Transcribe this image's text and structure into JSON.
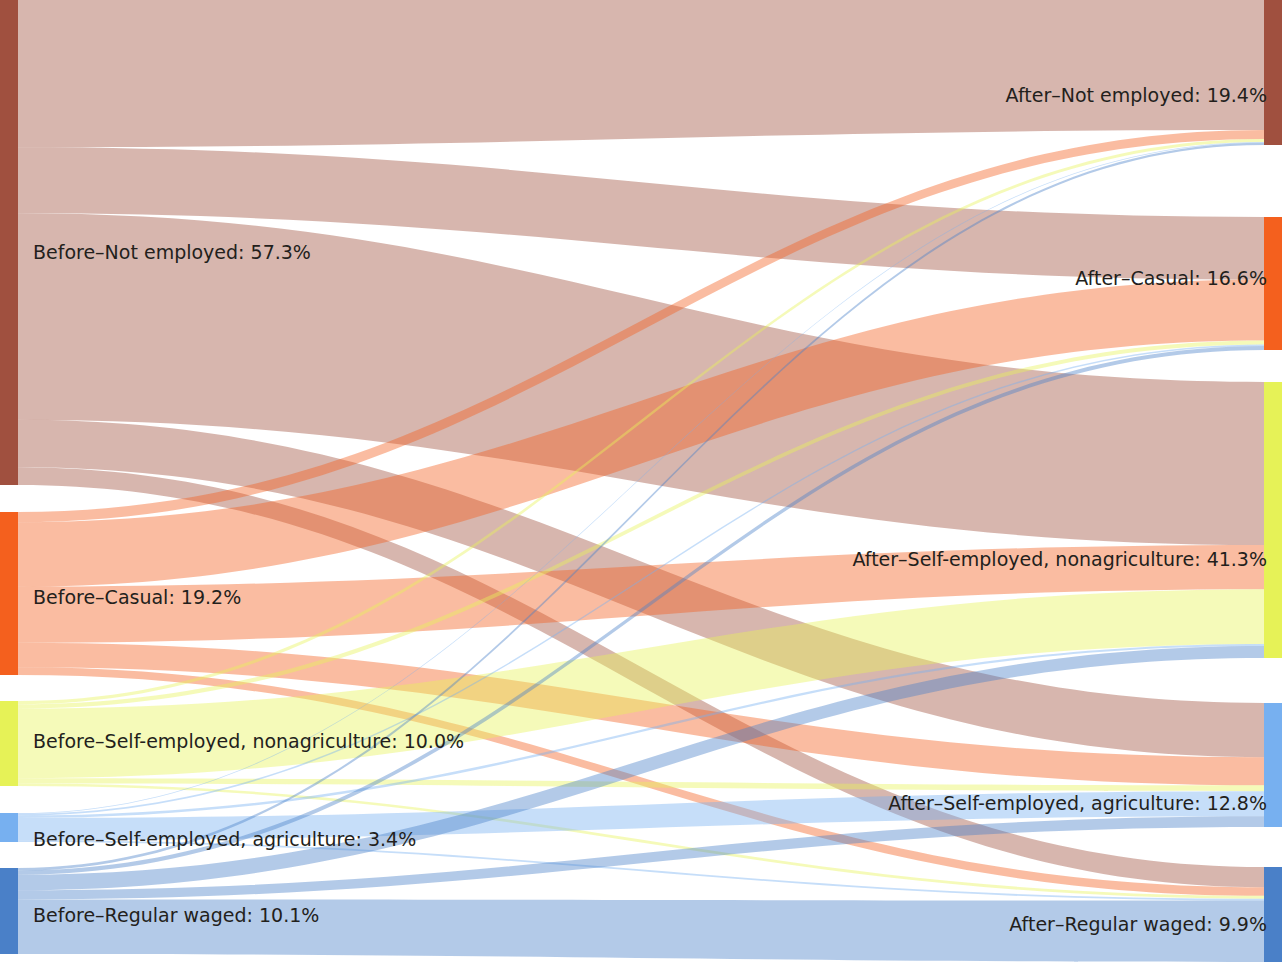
{
  "figure": {
    "type": "sankey",
    "title": "",
    "width": 1282,
    "height": 962,
    "background": "#ffffff",
    "label_separator": "–"
  },
  "chart_data": {
    "type": "sankey",
    "title": "",
    "xlabel": "",
    "ylabel": "",
    "units": "percent",
    "stage_labels": [
      "Before",
      "After"
    ],
    "nodes": [
      {
        "id": "before_not_employed",
        "stage": "Before",
        "label": "Before–Not employed: 57.3%",
        "name": "Not employed",
        "value": 57.3,
        "color": "#a0503f",
        "side": "left",
        "y0": 0,
        "y1": 485
      },
      {
        "id": "before_casual",
        "stage": "Before",
        "label": "Before–Casual: 19.2%",
        "name": "Casual",
        "value": 19.2,
        "color": "#f4601e",
        "side": "left",
        "y0": 512,
        "y1": 675
      },
      {
        "id": "before_self_nonagri",
        "stage": "Before",
        "label": "Before–Self-employed, nonagriculture: 10.0%",
        "name": "Self-employed, nonagriculture",
        "value": 10.0,
        "color": "#e6f257",
        "side": "left",
        "y0": 701,
        "y1": 786
      },
      {
        "id": "before_self_agri",
        "stage": "Before",
        "label": "Before–Self-employed, agriculture: 3.4%",
        "name": "Self-employed, agriculture",
        "value": 3.4,
        "color": "#77b0f0",
        "side": "left",
        "y0": 813,
        "y1": 842
      },
      {
        "id": "before_regular",
        "stage": "Before",
        "label": "Before–Regular waged: 10.1%",
        "name": "Regular waged",
        "value": 10.1,
        "color": "#4a80c8",
        "side": "left",
        "y0": 868,
        "y1": 954
      },
      {
        "id": "after_not_employed",
        "stage": "After",
        "label": "After–Not employed: 19.4%",
        "name": "Not employed",
        "value": 19.4,
        "color": "#a0503f",
        "side": "right",
        "y0": 0,
        "y1": 145
      },
      {
        "id": "after_casual",
        "stage": "After",
        "label": "After–Casual: 16.6%",
        "name": "Casual",
        "value": 16.6,
        "color": "#f4601e",
        "side": "right",
        "y0": 217,
        "y1": 350
      },
      {
        "id": "after_self_nonagri",
        "stage": "After",
        "label": "After–Self-employed, nonagriculture: 41.3%",
        "name": "Self-employed, nonagriculture",
        "value": 41.3,
        "color": "#e6f257",
        "side": "right",
        "y0": 382,
        "y1": 658
      },
      {
        "id": "after_self_agri",
        "stage": "After",
        "label": "After–Self-employed, agriculture: 12.8%",
        "name": "Self-employed, agriculture",
        "value": 12.8,
        "color": "#77b0f0",
        "side": "right",
        "y0": 703,
        "y1": 827
      },
      {
        "id": "after_regular",
        "stage": "After",
        "label": "After–Regular waged: 9.9%",
        "name": "Regular waged",
        "value": 9.9,
        "color": "#4a80c8",
        "side": "right",
        "y0": 867,
        "y1": 962
      }
    ],
    "links": [
      {
        "source": "before_not_employed",
        "target": "after_not_employed",
        "value": 17.4,
        "color": "#a0503f"
      },
      {
        "source": "before_not_employed",
        "target": "after_casual",
        "value": 7.8,
        "color": "#a0503f"
      },
      {
        "source": "before_not_employed",
        "target": "after_self_nonagri",
        "value": 24.4,
        "color": "#a0503f"
      },
      {
        "source": "before_not_employed",
        "target": "after_self_agri",
        "value": 5.6,
        "color": "#a0503f"
      },
      {
        "source": "before_not_employed",
        "target": "after_regular",
        "value": 2.1,
        "color": "#a0503f"
      },
      {
        "source": "before_casual",
        "target": "after_not_employed",
        "value": 1.2,
        "color": "#f4601e"
      },
      {
        "source": "before_casual",
        "target": "after_casual",
        "value": 7.6,
        "color": "#f4601e"
      },
      {
        "source": "before_casual",
        "target": "after_self_nonagri",
        "value": 6.6,
        "color": "#f4601e"
      },
      {
        "source": "before_casual",
        "target": "after_self_agri",
        "value": 2.9,
        "color": "#f4601e"
      },
      {
        "source": "before_casual",
        "target": "after_regular",
        "value": 0.9,
        "color": "#f4601e"
      },
      {
        "source": "before_self_nonagri",
        "target": "after_not_employed",
        "value": 0.4,
        "color": "#e6f257"
      },
      {
        "source": "before_self_nonagri",
        "target": "after_casual",
        "value": 0.5,
        "color": "#e6f257"
      },
      {
        "source": "before_self_nonagri",
        "target": "after_self_nonagri",
        "value": 8.2,
        "color": "#e6f257"
      },
      {
        "source": "before_self_nonagri",
        "target": "after_self_agri",
        "value": 0.6,
        "color": "#e6f257"
      },
      {
        "source": "before_self_nonagri",
        "target": "after_regular",
        "value": 0.3,
        "color": "#e6f257"
      },
      {
        "source": "before_self_agri",
        "target": "after_not_employed",
        "value": 0.1,
        "color": "#77b0f0"
      },
      {
        "source": "before_self_agri",
        "target": "after_casual",
        "value": 0.2,
        "color": "#77b0f0"
      },
      {
        "source": "before_self_agri",
        "target": "after_self_nonagri",
        "value": 0.3,
        "color": "#77b0f0"
      },
      {
        "source": "before_self_agri",
        "target": "after_self_agri",
        "value": 2.6,
        "color": "#77b0f0"
      },
      {
        "source": "before_self_agri",
        "target": "after_regular",
        "value": 0.2,
        "color": "#77b0f0"
      },
      {
        "source": "before_regular",
        "target": "after_not_employed",
        "value": 0.3,
        "color": "#4a80c8"
      },
      {
        "source": "before_regular",
        "target": "after_casual",
        "value": 0.5,
        "color": "#4a80c8"
      },
      {
        "source": "before_regular",
        "target": "after_self_nonagri",
        "value": 1.8,
        "color": "#4a80c8"
      },
      {
        "source": "before_regular",
        "target": "after_self_agri",
        "value": 1.1,
        "color": "#4a80c8"
      },
      {
        "source": "before_regular",
        "target": "after_regular",
        "value": 6.4,
        "color": "#4a80c8"
      }
    ]
  },
  "labels": {
    "left": [
      {
        "id": "before_not_employed",
        "text": "Before–Not employed: 57.3%",
        "x": 33,
        "y": 253
      },
      {
        "id": "before_casual",
        "text": "Before–Casual: 19.2%",
        "x": 33,
        "y": 598
      },
      {
        "id": "before_self_nonagri",
        "text": "Before–Self-employed, nonagriculture: 10.0%",
        "x": 33,
        "y": 742
      },
      {
        "id": "before_self_agri",
        "text": "Before–Self-employed, agriculture: 3.4%",
        "x": 33,
        "y": 840
      },
      {
        "id": "before_regular",
        "text": "Before–Regular waged: 10.1%",
        "x": 33,
        "y": 916
      }
    ],
    "right": [
      {
        "id": "after_not_employed",
        "text": "After–Not employed: 19.4%",
        "x": 1267,
        "y": 96
      },
      {
        "id": "after_casual",
        "text": "After–Casual: 16.6%",
        "x": 1267,
        "y": 279
      },
      {
        "id": "after_self_nonagri",
        "text": "After–Self-employed, nonagriculture: 41.3%",
        "x": 1267,
        "y": 560
      },
      {
        "id": "after_self_agri",
        "text": "After–Self-employed, agriculture: 12.8%",
        "x": 1267,
        "y": 804
      },
      {
        "id": "after_regular",
        "text": "After–Regular waged: 9.9%",
        "x": 1267,
        "y": 925
      }
    ]
  }
}
